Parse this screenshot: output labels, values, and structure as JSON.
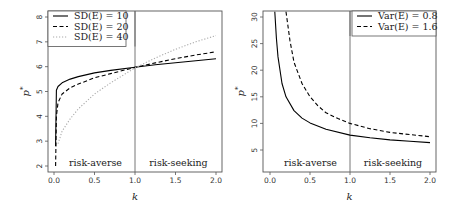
{
  "chart_data": [
    {
      "type": "line",
      "panel": "left",
      "title": "",
      "xlabel": "k",
      "ylabel": "p*",
      "xlim": [
        0,
        2
      ],
      "ylim": [
        2,
        8
      ],
      "xticks": [
        "0.0",
        "0.5",
        "1.0",
        "1.5",
        "2.0"
      ],
      "yticks": [
        "2",
        "3",
        "4",
        "5",
        "6",
        "7",
        "8"
      ],
      "vline": 1.0,
      "hline_legend_box": true,
      "annotations": [
        {
          "text": "risk-averse",
          "x": 0.5,
          "y": 2.2
        },
        {
          "text": "risk-seeking",
          "x": 1.5,
          "y": 2.2
        }
      ],
      "legend_position": "topleft",
      "series": [
        {
          "name": "SD(E) = 10",
          "style": "solid",
          "color": "#000000",
          "x": [
            0.02,
            0.03,
            0.05,
            0.1,
            0.2,
            0.3,
            0.5,
            0.7,
            1.0,
            1.25,
            1.5,
            1.75,
            2.0
          ],
          "y": [
            2.8,
            5.05,
            5.2,
            5.35,
            5.5,
            5.6,
            5.75,
            5.85,
            5.98,
            6.08,
            6.16,
            6.24,
            6.32
          ]
        },
        {
          "name": "SD(E) = 20",
          "style": "dashed",
          "color": "#000000",
          "x": [
            0.02,
            0.03,
            0.05,
            0.1,
            0.2,
            0.3,
            0.5,
            0.7,
            1.0,
            1.25,
            1.5,
            1.75,
            2.0
          ],
          "y": [
            2.0,
            4.0,
            4.55,
            4.9,
            5.15,
            5.3,
            5.55,
            5.72,
            5.97,
            6.15,
            6.32,
            6.47,
            6.6
          ]
        },
        {
          "name": "SD(E) = 40",
          "style": "dotted",
          "color": "#aaaaaa",
          "x": [
            0.05,
            0.1,
            0.2,
            0.3,
            0.5,
            0.7,
            1.0,
            1.25,
            1.5,
            1.75,
            2.0
          ],
          "y": [
            2.9,
            3.4,
            3.9,
            4.3,
            4.9,
            5.35,
            5.95,
            6.35,
            6.7,
            7.0,
            7.25
          ]
        }
      ]
    },
    {
      "type": "line",
      "panel": "right",
      "title": "",
      "xlabel": "k",
      "ylabel": "p*",
      "xlim": [
        0,
        2
      ],
      "ylim": [
        1,
        31
      ],
      "xticks": [
        "0.0",
        "0.5",
        "1.0",
        "1.5",
        "2.0"
      ],
      "yticks": [
        "5",
        "10",
        "15",
        "20",
        "25",
        "30"
      ],
      "vline": 1.0,
      "annotations": [
        {
          "text": "risk-averse",
          "x": 0.5,
          "y": 3
        },
        {
          "text": "risk-seeking",
          "x": 1.5,
          "y": 3
        }
      ],
      "legend_position": "topright",
      "series": [
        {
          "name": "Var(E) = 0.8",
          "style": "solid",
          "color": "#000000",
          "x": [
            0.06,
            0.08,
            0.1,
            0.15,
            0.2,
            0.3,
            0.4,
            0.5,
            0.7,
            1.0,
            1.25,
            1.5,
            1.75,
            2.0
          ],
          "y": [
            31,
            26,
            22.5,
            17.5,
            15,
            12.4,
            11,
            10.1,
            8.9,
            7.8,
            7.3,
            6.9,
            6.65,
            6.4
          ]
        },
        {
          "name": "Var(E) = 1.6",
          "style": "dashed",
          "color": "#000000",
          "x": [
            0.2,
            0.25,
            0.3,
            0.4,
            0.5,
            0.6,
            0.7,
            0.85,
            1.0,
            1.25,
            1.5,
            1.75,
            2.0
          ],
          "y": [
            31,
            25.5,
            21.5,
            17.5,
            15,
            13.3,
            12.0,
            10.9,
            10.0,
            9.0,
            8.3,
            7.9,
            7.5
          ]
        }
      ]
    }
  ],
  "left": {
    "ylabel": "p*",
    "xlabel": "k",
    "region_averse": "risk-averse",
    "region_seeking": "risk-seeking",
    "legend": [
      "SD(E) = 10",
      "SD(E) = 20",
      "SD(E) = 40"
    ]
  },
  "right": {
    "ylabel": "p*",
    "xlabel": "k",
    "region_averse": "risk-averse",
    "region_seeking": "risk-seeking",
    "legend": [
      "Var(E) = 0.8",
      "Var(E) = 1.6"
    ]
  }
}
